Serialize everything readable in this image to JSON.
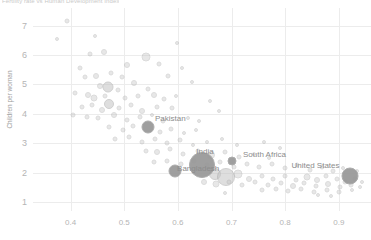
{
  "title": "Fertility rate vs Human Development Index",
  "axes": {
    "ylabel": "Children per woman",
    "xlabel": "",
    "yticks": [
      "1",
      "2",
      "3",
      "4",
      "5",
      "6",
      "7"
    ],
    "ytick_values": [
      1,
      2,
      3,
      4,
      5,
      6,
      7
    ],
    "xticks": [
      "0.4",
      "0.5",
      "0.6",
      "0.7",
      "0.8",
      "0.9"
    ],
    "xtick_values": [
      0.4,
      0.5,
      0.6,
      0.7,
      0.8,
      0.9
    ],
    "xlim": [
      0.33,
      0.96
    ],
    "ylim": [
      0.7,
      7.6
    ],
    "grid": true,
    "gridcolor": "#ececec"
  },
  "style": {
    "bubble_fill": "#c4c4c4",
    "bubble_stroke": "#a8a8a8",
    "bubble_fill_highlight": "#9a9a9a",
    "label_color": "#8c8c8c",
    "tick_color": "#b5b5b5",
    "axis_label_color": "#9e9e9e",
    "background": "#ffffff"
  },
  "chart_data": {
    "type": "scatter",
    "title": "Fertility rate vs Human Development Index",
    "xlabel": "",
    "ylabel": "Children per woman",
    "xlim": [
      0.33,
      0.96
    ],
    "ylim": [
      0.7,
      7.6
    ],
    "grid": true,
    "legend": "none",
    "size_encodes": "population",
    "annotated_points": [
      {
        "name": "Pakistan",
        "x": 0.545,
        "y": 3.55,
        "size": 13,
        "label_dx": 22,
        "label_dy": -9
      },
      {
        "name": "India",
        "x": 0.645,
        "y": 2.25,
        "size": 26,
        "label_dx": 3,
        "label_dy": -14
      },
      {
        "name": "Bangladesh",
        "x": 0.595,
        "y": 2.05,
        "size": 13,
        "label_dx": 23,
        "label_dy": -3
      },
      {
        "name": "South Africa",
        "x": 0.7,
        "y": 2.4,
        "size": 9,
        "label_dx": 33,
        "label_dy": -7
      },
      {
        "name": "United States",
        "x": 0.92,
        "y": 1.9,
        "size": 17,
        "label_dx": -34,
        "label_dy": -11
      }
    ],
    "points": [
      {
        "x": 0.393,
        "y": 7.15,
        "size": 5
      },
      {
        "x": 0.436,
        "y": 6.05,
        "size": 5
      },
      {
        "x": 0.462,
        "y": 6.1,
        "size": 6
      },
      {
        "x": 0.506,
        "y": 5.65,
        "size": 6
      },
      {
        "x": 0.54,
        "y": 5.95,
        "size": 9
      },
      {
        "x": 0.418,
        "y": 5.55,
        "size": 5
      },
      {
        "x": 0.427,
        "y": 5.25,
        "size": 5
      },
      {
        "x": 0.448,
        "y": 5.3,
        "size": 6
      },
      {
        "x": 0.476,
        "y": 5.4,
        "size": 5
      },
      {
        "x": 0.496,
        "y": 5.25,
        "size": 5
      },
      {
        "x": 0.565,
        "y": 5.7,
        "size": 5
      },
      {
        "x": 0.582,
        "y": 5.3,
        "size": 5
      },
      {
        "x": 0.607,
        "y": 5.55,
        "size": 4
      },
      {
        "x": 0.455,
        "y": 4.95,
        "size": 6
      },
      {
        "x": 0.47,
        "y": 4.9,
        "size": 11
      },
      {
        "x": 0.489,
        "y": 4.8,
        "size": 5
      },
      {
        "x": 0.519,
        "y": 5.05,
        "size": 6
      },
      {
        "x": 0.544,
        "y": 4.85,
        "size": 5
      },
      {
        "x": 0.409,
        "y": 4.7,
        "size": 5
      },
      {
        "x": 0.432,
        "y": 4.65,
        "size": 6
      },
      {
        "x": 0.443,
        "y": 4.55,
        "size": 7
      },
      {
        "x": 0.464,
        "y": 4.6,
        "size": 5
      },
      {
        "x": 0.501,
        "y": 4.55,
        "size": 5
      },
      {
        "x": 0.525,
        "y": 4.6,
        "size": 5
      },
      {
        "x": 0.556,
        "y": 4.65,
        "size": 6
      },
      {
        "x": 0.575,
        "y": 4.5,
        "size": 5
      },
      {
        "x": 0.596,
        "y": 4.6,
        "size": 4
      },
      {
        "x": 0.421,
        "y": 4.25,
        "size": 5
      },
      {
        "x": 0.44,
        "y": 4.3,
        "size": 5
      },
      {
        "x": 0.459,
        "y": 4.15,
        "size": 6
      },
      {
        "x": 0.472,
        "y": 4.35,
        "size": 10
      },
      {
        "x": 0.491,
        "y": 4.2,
        "size": 5
      },
      {
        "x": 0.513,
        "y": 4.3,
        "size": 5
      },
      {
        "x": 0.534,
        "y": 4.1,
        "size": 6
      },
      {
        "x": 0.561,
        "y": 4.25,
        "size": 5
      },
      {
        "x": 0.59,
        "y": 4.2,
        "size": 5
      },
      {
        "x": 0.405,
        "y": 3.95,
        "size": 5
      },
      {
        "x": 0.43,
        "y": 3.9,
        "size": 5
      },
      {
        "x": 0.452,
        "y": 3.85,
        "size": 5
      },
      {
        "x": 0.481,
        "y": 3.95,
        "size": 6
      },
      {
        "x": 0.505,
        "y": 3.8,
        "size": 5
      },
      {
        "x": 0.529,
        "y": 3.9,
        "size": 5
      },
      {
        "x": 0.552,
        "y": 3.95,
        "size": 4
      },
      {
        "x": 0.573,
        "y": 3.75,
        "size": 5
      },
      {
        "x": 0.618,
        "y": 3.85,
        "size": 4
      },
      {
        "x": 0.64,
        "y": 3.75,
        "size": 4
      },
      {
        "x": 0.472,
        "y": 3.55,
        "size": 5
      },
      {
        "x": 0.498,
        "y": 3.45,
        "size": 5
      },
      {
        "x": 0.516,
        "y": 3.6,
        "size": 5
      },
      {
        "x": 0.566,
        "y": 3.4,
        "size": 5
      },
      {
        "x": 0.588,
        "y": 3.5,
        "size": 5
      },
      {
        "x": 0.612,
        "y": 3.35,
        "size": 4
      },
      {
        "x": 0.634,
        "y": 3.45,
        "size": 4
      },
      {
        "x": 0.482,
        "y": 3.15,
        "size": 5
      },
      {
        "x": 0.509,
        "y": 3.2,
        "size": 5
      },
      {
        "x": 0.533,
        "y": 3.05,
        "size": 5
      },
      {
        "x": 0.558,
        "y": 3.15,
        "size": 5
      },
      {
        "x": 0.579,
        "y": 3.0,
        "size": 5
      },
      {
        "x": 0.604,
        "y": 3.1,
        "size": 5
      },
      {
        "x": 0.628,
        "y": 2.95,
        "size": 4
      },
      {
        "x": 0.655,
        "y": 3.05,
        "size": 4
      },
      {
        "x": 0.683,
        "y": 3.15,
        "size": 4
      },
      {
        "x": 0.711,
        "y": 2.95,
        "size": 4
      },
      {
        "x": 0.54,
        "y": 2.75,
        "size": 5
      },
      {
        "x": 0.562,
        "y": 2.7,
        "size": 6
      },
      {
        "x": 0.586,
        "y": 2.8,
        "size": 5
      },
      {
        "x": 0.61,
        "y": 2.65,
        "size": 5
      },
      {
        "x": 0.637,
        "y": 2.75,
        "size": 5
      },
      {
        "x": 0.662,
        "y": 2.6,
        "size": 8
      },
      {
        "x": 0.688,
        "y": 2.7,
        "size": 5
      },
      {
        "x": 0.714,
        "y": 2.55,
        "size": 5
      },
      {
        "x": 0.742,
        "y": 2.65,
        "size": 4
      },
      {
        "x": 0.77,
        "y": 2.5,
        "size": 4
      },
      {
        "x": 0.556,
        "y": 2.35,
        "size": 5
      },
      {
        "x": 0.58,
        "y": 2.4,
        "size": 5
      },
      {
        "x": 0.605,
        "y": 2.3,
        "size": 5
      },
      {
        "x": 0.63,
        "y": 2.4,
        "size": 5
      },
      {
        "x": 0.655,
        "y": 2.25,
        "size": 5
      },
      {
        "x": 0.678,
        "y": 2.35,
        "size": 5
      },
      {
        "x": 0.704,
        "y": 2.2,
        "size": 5
      },
      {
        "x": 0.728,
        "y": 2.3,
        "size": 5
      },
      {
        "x": 0.752,
        "y": 2.2,
        "size": 5
      },
      {
        "x": 0.776,
        "y": 2.3,
        "size": 5
      },
      {
        "x": 0.8,
        "y": 2.15,
        "size": 5
      },
      {
        "x": 0.822,
        "y": 2.25,
        "size": 5
      },
      {
        "x": 0.846,
        "y": 2.1,
        "size": 5
      },
      {
        "x": 0.868,
        "y": 2.2,
        "size": 5
      },
      {
        "x": 0.89,
        "y": 2.05,
        "size": 5
      },
      {
        "x": 0.908,
        "y": 2.15,
        "size": 4
      },
      {
        "x": 0.934,
        "y": 2.05,
        "size": 4
      },
      {
        "x": 0.669,
        "y": 1.95,
        "size": 12
      },
      {
        "x": 0.69,
        "y": 1.85,
        "size": 18
      },
      {
        "x": 0.712,
        "y": 1.95,
        "size": 9
      },
      {
        "x": 0.732,
        "y": 1.8,
        "size": 6
      },
      {
        "x": 0.756,
        "y": 1.9,
        "size": 5
      },
      {
        "x": 0.778,
        "y": 1.8,
        "size": 5
      },
      {
        "x": 0.8,
        "y": 1.9,
        "size": 5
      },
      {
        "x": 0.82,
        "y": 1.75,
        "size": 5
      },
      {
        "x": 0.84,
        "y": 1.85,
        "size": 7
      },
      {
        "x": 0.86,
        "y": 1.75,
        "size": 6
      },
      {
        "x": 0.876,
        "y": 1.88,
        "size": 5
      },
      {
        "x": 0.896,
        "y": 1.78,
        "size": 5
      },
      {
        "x": 0.912,
        "y": 1.68,
        "size": 5
      },
      {
        "x": 0.93,
        "y": 1.8,
        "size": 5
      },
      {
        "x": 0.944,
        "y": 1.7,
        "size": 4
      },
      {
        "x": 0.648,
        "y": 1.7,
        "size": 6
      },
      {
        "x": 0.672,
        "y": 1.62,
        "size": 7
      },
      {
        "x": 0.696,
        "y": 1.7,
        "size": 5
      },
      {
        "x": 0.72,
        "y": 1.6,
        "size": 5
      },
      {
        "x": 0.744,
        "y": 1.68,
        "size": 5
      },
      {
        "x": 0.768,
        "y": 1.58,
        "size": 5
      },
      {
        "x": 0.792,
        "y": 1.66,
        "size": 5
      },
      {
        "x": 0.814,
        "y": 1.56,
        "size": 6
      },
      {
        "x": 0.836,
        "y": 1.64,
        "size": 5
      },
      {
        "x": 0.858,
        "y": 1.54,
        "size": 5
      },
      {
        "x": 0.88,
        "y": 1.62,
        "size": 6
      },
      {
        "x": 0.902,
        "y": 1.52,
        "size": 5
      },
      {
        "x": 0.922,
        "y": 1.6,
        "size": 5
      },
      {
        "x": 0.94,
        "y": 1.5,
        "size": 4
      },
      {
        "x": 0.756,
        "y": 1.4,
        "size": 5
      },
      {
        "x": 0.782,
        "y": 1.45,
        "size": 5
      },
      {
        "x": 0.806,
        "y": 1.38,
        "size": 5
      },
      {
        "x": 0.83,
        "y": 1.44,
        "size": 5
      },
      {
        "x": 0.854,
        "y": 1.36,
        "size": 5
      },
      {
        "x": 0.878,
        "y": 1.42,
        "size": 5
      },
      {
        "x": 0.9,
        "y": 1.34,
        "size": 5
      },
      {
        "x": 0.924,
        "y": 1.4,
        "size": 4
      },
      {
        "x": 0.688,
        "y": 1.3,
        "size": 4
      },
      {
        "x": 0.862,
        "y": 1.25,
        "size": 4
      },
      {
        "x": 0.886,
        "y": 1.22,
        "size": 4
      },
      {
        "x": 0.374,
        "y": 6.55,
        "size": 4
      },
      {
        "x": 0.598,
        "y": 6.4,
        "size": 4
      },
      {
        "x": 0.445,
        "y": 6.65,
        "size": 4
      },
      {
        "x": 0.676,
        "y": 4.1,
        "size": 4
      },
      {
        "x": 0.659,
        "y": 4.45,
        "size": 4
      },
      {
        "x": 0.626,
        "y": 5.1,
        "size": 4
      },
      {
        "x": 0.76,
        "y": 3.05,
        "size": 4
      },
      {
        "x": 0.79,
        "y": 2.85,
        "size": 4
      }
    ]
  }
}
